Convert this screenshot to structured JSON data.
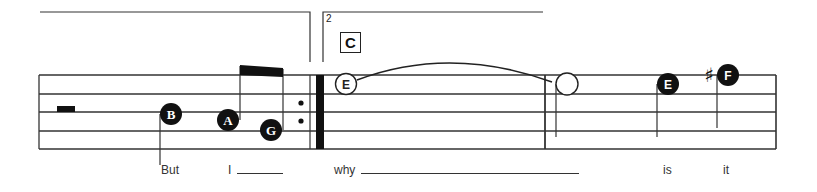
{
  "score": {
    "staff": {
      "lines_y": [
        75,
        94,
        112,
        131,
        149
      ],
      "left_x": 39,
      "right_x": 776
    },
    "volta": {
      "first_ending": {
        "x1": 40,
        "x2": 309,
        "y": 12
      },
      "second_ending": {
        "number": "2",
        "x1": 323,
        "x2": 543,
        "y": 12
      }
    },
    "rehearsal_mark": "C",
    "notes": [
      {
        "letter": "B",
        "filled": true,
        "cx": 171,
        "cy": 114
      },
      {
        "letter": "A",
        "filled": true,
        "cx": 228,
        "cy": 120
      },
      {
        "letter": "G",
        "filled": true,
        "cx": 271,
        "cy": 130
      },
      {
        "letter": "E",
        "filled": false,
        "cx": 346,
        "cy": 84
      },
      {
        "letter": "",
        "filled": false,
        "cx": 567,
        "cy": 84
      },
      {
        "letter": "E",
        "filled": true,
        "cx": 668,
        "cy": 84
      },
      {
        "letter": "F",
        "filled": true,
        "cx": 728,
        "cy": 75,
        "accidental": "♯"
      }
    ],
    "lyrics": [
      {
        "text": "But",
        "x": 161,
        "line": false
      },
      {
        "text": "I",
        "x": 228,
        "line": true,
        "line_width": 46
      },
      {
        "text": "why",
        "x": 334,
        "line": true,
        "line_width": 218
      },
      {
        "text": "is",
        "x": 663,
        "line": false
      },
      {
        "text": "it",
        "x": 723,
        "line": false
      }
    ]
  }
}
